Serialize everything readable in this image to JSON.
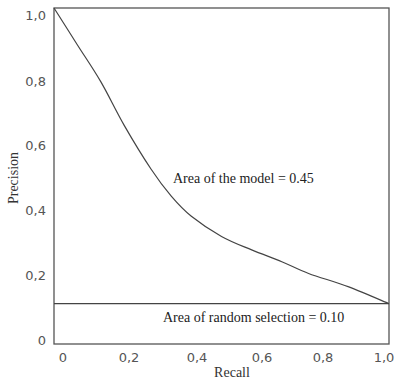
{
  "chart_data": {
    "type": "line",
    "title": "",
    "xlabel": "Recall",
    "ylabel": "Precision",
    "xlim": [
      0,
      1.0
    ],
    "ylim": [
      0,
      1.0
    ],
    "grid": false,
    "legend": null,
    "x_ticks": [
      "0",
      "0,2",
      "0,4",
      "0,6",
      "0,8",
      "1,0"
    ],
    "y_ticks": [
      "0",
      "0,2",
      "0,4",
      "0,6",
      "0,8",
      "1,0"
    ],
    "series": [
      {
        "name": "Model precision-recall curve",
        "x": [
          0.0,
          0.07,
          0.14,
          0.21,
          0.29,
          0.35,
          0.41,
          0.5,
          0.59,
          0.68,
          0.76,
          0.88,
          1.0
        ],
        "y": [
          1.0,
          0.89,
          0.78,
          0.65,
          0.52,
          0.44,
          0.38,
          0.32,
          0.28,
          0.245,
          0.21,
          0.17,
          0.12
        ]
      },
      {
        "name": "Random selection baseline",
        "x": [
          0.0,
          1.0
        ],
        "y": [
          0.12,
          0.12
        ]
      }
    ],
    "annotations": [
      {
        "text": "Area of the model = 0.45",
        "x": 0.58,
        "y": 0.45
      },
      {
        "text": "Area of random selection = 0.10",
        "x": 0.61,
        "y": 0.06
      }
    ]
  },
  "labels": {
    "xlabel": "Recall",
    "ylabel": "Precision",
    "model_area": "Area of the model = 0.45",
    "random_area": "Area of random selection = 0.10",
    "xt0": "0",
    "xt1": "0,2",
    "xt2": "0,4",
    "xt3": "0,6",
    "xt4": "0,8",
    "xt5": "1,0",
    "yt0": "0",
    "yt1": "0,2",
    "yt2": "0,4",
    "yt3": "0,6",
    "yt4": "0,8",
    "yt5": "1,0"
  }
}
